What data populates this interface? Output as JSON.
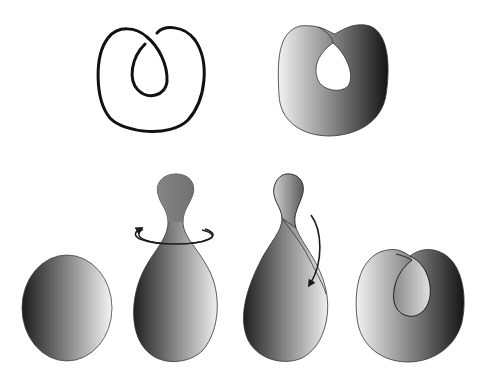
{
  "figure": {
    "panels": [
      {
        "id": "knot-curve",
        "row": "top",
        "label": ""
      },
      {
        "id": "spanning-surface",
        "row": "top",
        "label": ""
      },
      {
        "id": "sphere",
        "row": "bottom",
        "label": ""
      },
      {
        "id": "pinched-sphere-rotating",
        "row": "bottom",
        "label": ""
      },
      {
        "id": "twisted-sphere-folding",
        "row": "bottom",
        "label": ""
      },
      {
        "id": "folded-surface",
        "row": "bottom",
        "label": ""
      }
    ],
    "arrows": [
      {
        "id": "rotation-arrow",
        "kind": "horizontal ellipse around neck"
      },
      {
        "id": "fold-arrow",
        "kind": "curved downward arrow"
      }
    ],
    "colors": {
      "background": "#ffffff",
      "stroke": "#1a1a1a",
      "shade_dark": "#1c1c1c",
      "shade_mid": "#7a7a7a",
      "shade_light": "#f2f2f2"
    }
  }
}
